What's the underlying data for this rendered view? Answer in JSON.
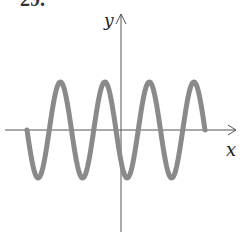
{
  "problem_number": "29.",
  "axes": {
    "x_label": "x",
    "y_label": "y"
  },
  "curve": {
    "type": "sinusoid",
    "color": "#8a8a8a",
    "x_start": 27,
    "x_end": 205,
    "baseline_y": 130,
    "amplitude_px": 48,
    "period_px": 44.5,
    "phase": "starts at baseline heading downward"
  },
  "colors": {
    "axis": "#555555",
    "curve": "#8a8a8a",
    "text": "#222222"
  }
}
